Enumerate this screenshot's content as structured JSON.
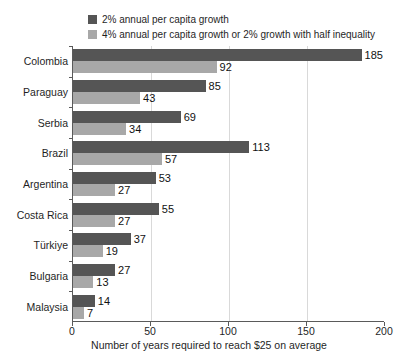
{
  "chart_data": {
    "type": "bar",
    "orientation": "horizontal",
    "title": "",
    "xlabel": "Number of years required to reach $25 on average",
    "ylabel": "",
    "xlim": [
      0,
      200
    ],
    "xticks": [
      0,
      50,
      100,
      150,
      200
    ],
    "grid": true,
    "legend_position": "top-left",
    "categories": [
      "Colombia",
      "Paraguay",
      "Serbia",
      "Brazil",
      "Argentina",
      "Costa Rica",
      "Türkiye",
      "Bulgaria",
      "Malaysia"
    ],
    "series": [
      {
        "name": "2% annual per capita growth",
        "color": "#555555",
        "values": [
          185,
          85,
          69,
          113,
          53,
          55,
          37,
          27,
          14
        ]
      },
      {
        "name": "4% annual per capita growth or 2% growth with half inequality",
        "color": "#a8a8a8",
        "values": [
          92,
          43,
          34,
          57,
          27,
          27,
          19,
          13,
          7
        ]
      }
    ]
  },
  "legend": {
    "items": [
      {
        "label": "2% annual per capita growth",
        "color": "#555555"
      },
      {
        "label": "4% annual per capita growth or 2% growth with half inequality",
        "color": "#a8a8a8"
      }
    ]
  },
  "axis": {
    "x_label": "Number of years required to reach $25 on average",
    "x_ticks": [
      "0",
      "50",
      "100",
      "150",
      "200"
    ]
  }
}
